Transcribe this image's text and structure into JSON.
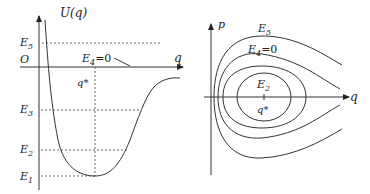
{
  "left_panel": {
    "y_axis_label": "U(q)",
    "x_axis_label": "q",
    "origin_label": "O",
    "levels": {
      "E5": {
        "base": "E",
        "sub": "5"
      },
      "E3": {
        "base": "E",
        "sub": "3"
      },
      "E2": {
        "base": "E",
        "sub": "2"
      },
      "E1": {
        "base": "E",
        "sub": "1"
      }
    },
    "e4_label": {
      "base": "E",
      "sub": "4",
      "suffix": "=0"
    },
    "qstar_label": "q*"
  },
  "right_panel": {
    "y_axis_label": "p",
    "x_axis_label": "q",
    "e5_label": {
      "base": "E",
      "sub": "5"
    },
    "e4_label": {
      "base": "E",
      "sub": "4",
      "suffix": "=0"
    },
    "e2_label": {
      "base": "E",
      "sub": "2"
    },
    "qstar_label": "q*"
  }
}
